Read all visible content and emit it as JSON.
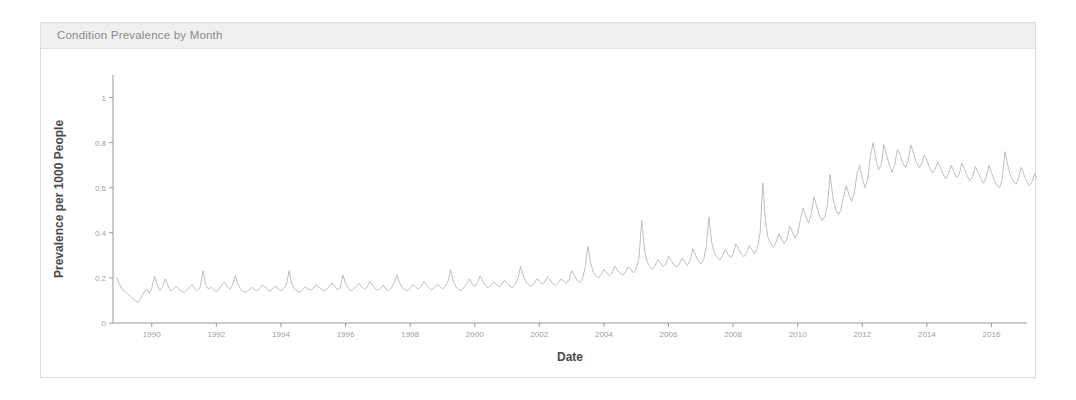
{
  "panel": {
    "title": "Condition Prevalence by Month"
  },
  "chart_data": {
    "type": "line",
    "title": "Condition Prevalence by Month",
    "xlabel": "Date",
    "ylabel": "Prevalence per 1000 People",
    "xlim": [
      1988.8,
      2017.1
    ],
    "ylim": [
      0,
      1.1
    ],
    "grid": false,
    "legend": null,
    "line_color": "#b8b8b8",
    "x_ticks": [
      1990,
      1992,
      1994,
      1996,
      1998,
      2000,
      2002,
      2004,
      2006,
      2008,
      2010,
      2012,
      2014,
      2016
    ],
    "x_tick_labels": [
      "1990",
      "1992",
      "1994",
      "1996",
      "1998",
      "2000",
      "2002",
      "2004",
      "2006",
      "2008",
      "2010",
      "2012",
      "2014",
      "2016"
    ],
    "y_ticks": [
      0,
      0.2,
      0.4,
      0.6,
      0.8,
      1
    ],
    "y_tick_labels": [
      "0",
      "0.2",
      "0.4",
      "0.6",
      "0.8",
      "1"
    ],
    "series": [
      {
        "name": "Prevalence per 1000 People",
        "x_start": 1988.92,
        "x_step": 0.08333,
        "values": [
          0.2,
          0.172,
          0.15,
          0.141,
          0.128,
          0.118,
          0.108,
          0.098,
          0.092,
          0.112,
          0.133,
          0.15,
          0.131,
          0.156,
          0.208,
          0.168,
          0.146,
          0.16,
          0.196,
          0.166,
          0.141,
          0.15,
          0.163,
          0.151,
          0.142,
          0.136,
          0.147,
          0.158,
          0.172,
          0.151,
          0.143,
          0.16,
          0.233,
          0.171,
          0.15,
          0.158,
          0.146,
          0.138,
          0.152,
          0.168,
          0.183,
          0.161,
          0.15,
          0.168,
          0.211,
          0.172,
          0.148,
          0.14,
          0.136,
          0.147,
          0.158,
          0.15,
          0.142,
          0.152,
          0.168,
          0.16,
          0.148,
          0.141,
          0.153,
          0.165,
          0.15,
          0.143,
          0.152,
          0.17,
          0.232,
          0.175,
          0.151,
          0.141,
          0.136,
          0.148,
          0.16,
          0.152,
          0.145,
          0.155,
          0.171,
          0.16,
          0.15,
          0.143,
          0.151,
          0.164,
          0.178,
          0.16,
          0.148,
          0.158,
          0.214,
          0.176,
          0.152,
          0.143,
          0.15,
          0.162,
          0.175,
          0.161,
          0.15,
          0.16,
          0.186,
          0.168,
          0.152,
          0.145,
          0.155,
          0.168,
          0.15,
          0.143,
          0.155,
          0.176,
          0.214,
          0.18,
          0.158,
          0.148,
          0.142,
          0.156,
          0.17,
          0.16,
          0.15,
          0.163,
          0.185,
          0.17,
          0.155,
          0.147,
          0.158,
          0.172,
          0.162,
          0.152,
          0.162,
          0.183,
          0.236,
          0.186,
          0.16,
          0.15,
          0.145,
          0.158,
          0.175,
          0.196,
          0.172,
          0.162,
          0.18,
          0.21,
          0.185,
          0.165,
          0.155,
          0.166,
          0.18,
          0.172,
          0.16,
          0.17,
          0.19,
          0.176,
          0.163,
          0.158,
          0.172,
          0.196,
          0.25,
          0.21,
          0.182,
          0.17,
          0.162,
          0.176,
          0.196,
          0.186,
          0.172,
          0.182,
          0.206,
          0.19,
          0.175,
          0.166,
          0.178,
          0.195,
          0.186,
          0.176,
          0.192,
          0.232,
          0.21,
          0.19,
          0.18,
          0.196,
          0.248,
          0.34,
          0.27,
          0.226,
          0.21,
          0.2,
          0.216,
          0.238,
          0.224,
          0.21,
          0.222,
          0.252,
          0.236,
          0.22,
          0.212,
          0.226,
          0.25,
          0.236,
          0.222,
          0.24,
          0.29,
          0.455,
          0.33,
          0.272,
          0.252,
          0.238,
          0.256,
          0.282,
          0.266,
          0.25,
          0.262,
          0.296,
          0.278,
          0.258,
          0.248,
          0.262,
          0.288,
          0.272,
          0.256,
          0.276,
          0.33,
          0.3,
          0.276,
          0.262,
          0.28,
          0.34,
          0.47,
          0.36,
          0.31,
          0.29,
          0.278,
          0.298,
          0.326,
          0.306,
          0.29,
          0.306,
          0.352,
          0.33,
          0.306,
          0.294,
          0.312,
          0.344,
          0.326,
          0.308,
          0.33,
          0.4,
          0.62,
          0.45,
          0.375,
          0.352,
          0.336,
          0.36,
          0.396,
          0.372,
          0.352,
          0.372,
          0.43,
          0.404,
          0.376,
          0.4,
          0.46,
          0.51,
          0.47,
          0.445,
          0.48,
          0.56,
          0.52,
          0.478,
          0.455,
          0.47,
          0.52,
          0.66,
          0.56,
          0.505,
          0.48,
          0.5,
          0.56,
          0.61,
          0.57,
          0.54,
          0.575,
          0.66,
          0.7,
          0.64,
          0.6,
          0.64,
          0.74,
          0.8,
          0.73,
          0.68,
          0.7,
          0.79,
          0.745,
          0.7,
          0.67,
          0.7,
          0.77,
          0.745,
          0.71,
          0.69,
          0.72,
          0.79,
          0.755,
          0.715,
          0.69,
          0.705,
          0.745,
          0.72,
          0.69,
          0.665,
          0.68,
          0.715,
          0.69,
          0.66,
          0.64,
          0.66,
          0.7,
          0.672,
          0.645,
          0.66,
          0.71,
          0.68,
          0.65,
          0.63,
          0.65,
          0.695,
          0.668,
          0.64,
          0.62,
          0.645,
          0.7,
          0.665,
          0.636,
          0.61,
          0.6,
          0.64,
          0.76,
          0.7,
          0.655,
          0.63,
          0.615,
          0.64,
          0.69,
          0.66,
          0.63,
          0.61,
          0.625,
          0.665,
          0.64,
          0.612,
          0.59,
          0.575,
          0.6,
          0.66,
          0.625,
          0.598,
          0.58,
          0.596,
          0.64,
          0.612,
          0.585,
          0.565,
          0.58,
          0.625,
          0.7,
          0.66,
          0.62,
          0.6,
          0.56,
          0.52,
          0.56,
          0.62,
          0.58,
          0.545,
          0.53,
          0.56,
          0.64,
          0.88,
          1.06,
          0.9,
          0.64,
          0.52,
          0.7,
          0.98,
          0.86,
          0.7,
          0.6,
          0.56,
          0.6,
          0.66,
          0.62,
          0.59,
          0.565,
          0.58,
          0.62,
          0.596,
          0.57,
          0.552,
          0.566,
          0.6,
          0.578,
          0.556,
          0.54,
          0.552,
          0.585,
          0.625,
          0.6,
          0.575,
          0.556,
          0.568,
          0.6,
          0.58,
          0.558,
          0.542,
          0.556,
          0.59,
          0.572,
          0.55,
          0.535,
          0.548,
          0.58,
          0.62,
          0.596,
          0.572,
          0.556,
          0.568,
          0.6,
          0.578,
          0.556,
          0.54,
          0.552,
          0.584,
          0.566,
          0.545,
          0.53,
          0.542,
          0.575,
          0.612,
          0.59,
          0.568,
          0.552,
          0.564,
          0.596,
          0.575,
          0.553,
          0.538,
          0.55,
          0.582,
          0.563,
          0.542,
          0.528,
          0.54,
          0.572,
          0.605,
          0.583,
          0.562,
          0.546,
          0.558,
          0.59,
          0.57,
          0.548,
          0.533,
          0.545,
          0.576,
          0.558,
          0.538,
          0.523,
          0.535,
          0.566,
          0.6,
          0.578,
          0.556,
          0.54,
          0.552,
          0.583,
          0.563,
          0.542,
          0.527,
          0.539,
          0.57,
          0.552,
          0.532,
          0.518,
          0.53,
          0.56,
          0.592,
          0.57,
          0.549,
          0.533,
          0.545,
          0.575,
          0.555,
          0.534,
          0.52,
          0.51,
          0.525,
          0.548,
          0.53,
          0.512,
          0.5,
          0.512,
          0.54,
          0.568,
          0.548,
          0.528,
          0.513,
          0.5,
          0.52,
          0.505,
          0.487,
          0.474,
          0.486,
          0.512,
          0.495,
          0.477,
          0.465,
          0.476,
          0.5,
          0.528,
          0.51,
          0.492,
          0.478,
          0.466,
          0.484,
          0.47,
          0.453,
          0.441,
          0.452,
          0.476,
          0.46,
          0.444,
          0.432,
          0.442,
          0.465,
          0.49,
          0.473,
          0.456,
          0.443,
          0.432,
          0.448,
          0.435,
          0.42,
          0.409,
          0.419,
          0.441,
          0.466,
          0.45,
          0.434,
          0.422,
          0.432,
          0.455,
          0.48,
          0.463,
          0.446,
          0.434,
          0.423,
          0.438,
          0.425,
          0.41,
          0.399,
          0.408,
          0.43,
          0.415,
          0.4,
          0.389,
          0.398,
          0.42,
          0.405,
          0.345,
          0.28,
          0.225,
          0.19,
          0.165
        ]
      }
    ]
  }
}
